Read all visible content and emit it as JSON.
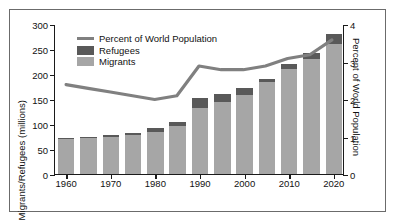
{
  "chart_data": {
    "type": "bar",
    "title": "",
    "xlabel": "",
    "ylabel": "Migrants/Refugees (millions)",
    "y2label": "Percent of World Population",
    "ylim": [
      0,
      300
    ],
    "y2lim": [
      0,
      4
    ],
    "yticks": [
      "0",
      "50",
      "100",
      "150",
      "200",
      "250",
      "300"
    ],
    "y2ticks": [
      "0",
      "1",
      "2",
      "3",
      "4"
    ],
    "categories": [
      "1960",
      "1965",
      "1970",
      "1975",
      "1980",
      "1985",
      "1990",
      "1995",
      "2000",
      "2005",
      "2010",
      "2015",
      "2020"
    ],
    "xticks": [
      "1960",
      "1970",
      "1980",
      "1990",
      "2000",
      "2010",
      "2020"
    ],
    "grid": false,
    "legend_position": "top-left",
    "series": [
      {
        "name": "Migrants",
        "type": "bar",
        "color": "#a6a6a6",
        "values": [
          70,
          72,
          75,
          78,
          85,
          96,
          133,
          145,
          158,
          184,
          210,
          230,
          260
        ]
      },
      {
        "name": "Refugees",
        "type": "bar",
        "color": "#595959",
        "values": [
          3,
          3,
          3,
          4,
          8,
          8,
          19,
          15,
          14,
          6,
          10,
          13,
          20
        ]
      },
      {
        "name": "Percent of World Population",
        "type": "line",
        "color": "#808080",
        "axis": "right",
        "values": [
          2.4,
          2.3,
          2.2,
          2.1,
          2.0,
          2.1,
          2.9,
          2.8,
          2.8,
          2.9,
          3.1,
          3.2,
          3.6
        ]
      }
    ],
    "totals": [
      73,
      75,
      78,
      82,
      93,
      104,
      152,
      160,
      172,
      190,
      220,
      243,
      280
    ]
  },
  "legend": {
    "items": [
      {
        "label": "Percent of World Population",
        "marker": "line",
        "color": "#808080"
      },
      {
        "label": "Refugees",
        "marker": "swatch",
        "color": "#595959"
      },
      {
        "label": "Migrants",
        "marker": "swatch",
        "color": "#a6a6a6"
      }
    ]
  }
}
